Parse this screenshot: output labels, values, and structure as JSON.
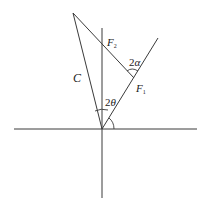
{
  "diagram": {
    "type": "vector-force-diagram",
    "labels": {
      "f2": {
        "base": "F",
        "sub": "2"
      },
      "f1": {
        "base": "F",
        "sub": "1"
      },
      "c": "C",
      "angle_alpha": {
        "coef": "2",
        "sym": "α"
      },
      "angle_theta": {
        "coef": "2",
        "sym": "θ"
      }
    },
    "colors": {
      "line": "#3a3a3a",
      "text": "#222222",
      "background": "#ffffff"
    },
    "geometry": {
      "origin": [
        102,
        129
      ],
      "apex": [
        73,
        13
      ],
      "f1_end": [
        158,
        38
      ],
      "intersection": [
        134,
        78
      ],
      "vertical_axis": [
        [
          102,
          28
        ],
        [
          102,
          198
        ]
      ],
      "horizontal_axis": [
        [
          14,
          129
        ],
        [
          197,
          129
        ]
      ]
    }
  }
}
